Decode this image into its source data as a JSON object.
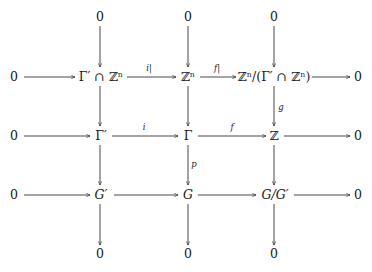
{
  "diagram": {
    "type": "commutative-diagram",
    "ink_color": "#1a1a1a",
    "background": "#ffffff",
    "nodes": {
      "top_0": "0",
      "top_1": "0",
      "top_2": "0",
      "r1_left": "0",
      "r1_c1": "Γ′ ∩ ℤⁿ",
      "r1_c2": "ℤⁿ",
      "r1_c3": "ℤⁿ/(Γ′ ∩ ℤⁿ)",
      "r1_right": "0",
      "r2_left": "0",
      "r2_c1": "Γ′",
      "r2_c2": "Γ",
      "r2_c3": "ℤ",
      "r2_right": "0",
      "r3_left": "0",
      "r3_c1": "G′",
      "r3_c2": "G",
      "r3_c3": "G/G′",
      "r3_right": "0",
      "bot_0": "0",
      "bot_1": "0",
      "bot_2": "0"
    },
    "arrow_labels": {
      "i_restricted": "i|",
      "f_restricted": "f|",
      "i": "i",
      "f": "f",
      "g": "g",
      "p": "p"
    },
    "rows": [
      [
        "0",
        "Γ′ ∩ ℤⁿ",
        "ℤⁿ",
        "ℤⁿ/(Γ′ ∩ ℤⁿ)",
        "0"
      ],
      [
        "0",
        "Γ′",
        "Γ",
        "ℤ",
        "0"
      ],
      [
        "0",
        "G′",
        "G",
        "G/G′",
        "0"
      ]
    ],
    "horizontal_arrows": [
      {
        "from": "0",
        "to": "Γ′ ∩ ℤⁿ",
        "label": ""
      },
      {
        "from": "Γ′ ∩ ℤⁿ",
        "to": "ℤⁿ",
        "label": "i|"
      },
      {
        "from": "ℤⁿ",
        "to": "ℤⁿ/(Γ′ ∩ ℤⁿ)",
        "label": "f|"
      },
      {
        "from": "ℤⁿ/(Γ′ ∩ ℤⁿ)",
        "to": "0",
        "label": ""
      },
      {
        "from": "0",
        "to": "Γ′",
        "label": ""
      },
      {
        "from": "Γ′",
        "to": "Γ",
        "label": "i"
      },
      {
        "from": "Γ",
        "to": "ℤ",
        "label": "f"
      },
      {
        "from": "ℤ",
        "to": "0",
        "label": ""
      },
      {
        "from": "0",
        "to": "G′",
        "label": ""
      },
      {
        "from": "G′",
        "to": "G",
        "label": ""
      },
      {
        "from": "G",
        "to": "G/G′",
        "label": ""
      },
      {
        "from": "G/G′",
        "to": "0",
        "label": ""
      }
    ],
    "vertical_arrows": [
      {
        "from": "0",
        "to": "Γ′ ∩ ℤⁿ",
        "label": ""
      },
      {
        "from": "Γ′ ∩ ℤⁿ",
        "to": "Γ′",
        "label": ""
      },
      {
        "from": "Γ′",
        "to": "G′",
        "label": ""
      },
      {
        "from": "G′",
        "to": "0",
        "label": ""
      },
      {
        "from": "0",
        "to": "ℤⁿ",
        "label": ""
      },
      {
        "from": "ℤⁿ",
        "to": "Γ",
        "label": ""
      },
      {
        "from": "Γ",
        "to": "G",
        "label": "p"
      },
      {
        "from": "G",
        "to": "0",
        "label": ""
      },
      {
        "from": "0",
        "to": "ℤⁿ/(Γ′ ∩ ℤⁿ)",
        "label": ""
      },
      {
        "from": "ℤⁿ/(Γ′ ∩ ℤⁿ)",
        "to": "ℤ",
        "label": "g"
      },
      {
        "from": "ℤ",
        "to": "G/G′",
        "label": ""
      },
      {
        "from": "G/G′",
        "to": "0",
        "label": ""
      }
    ]
  }
}
